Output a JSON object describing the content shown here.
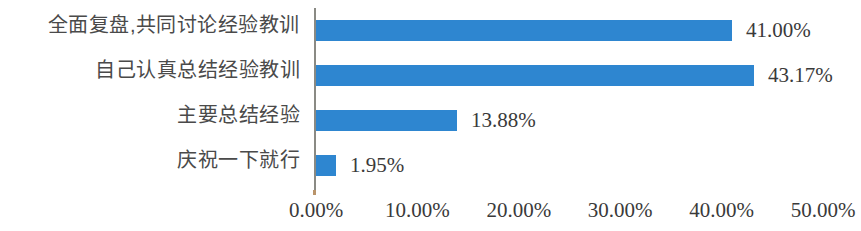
{
  "chart_data": {
    "type": "bar",
    "orientation": "horizontal",
    "title": "",
    "subtitle": "",
    "xlabel": "",
    "ylabel": "",
    "categories": [
      "全面复盘,共同讨论经验教训",
      "自己认真总结经验教训",
      "主要总结经验",
      "庆祝一下就行"
    ],
    "values": [
      41.0,
      43.17,
      13.88,
      1.95
    ],
    "value_labels": [
      "41.00%",
      "43.17%",
      "13.88%",
      "1.95%"
    ],
    "xlim": [
      0,
      50
    ],
    "xticks": [
      0,
      10,
      20,
      30,
      40,
      50
    ],
    "xtick_labels": [
      "0.00%",
      "10.00%",
      "20.00%",
      "30.00%",
      "40.00%",
      "50.00%"
    ],
    "grid": false,
    "legend": false,
    "legend_position": "none",
    "series": [
      {
        "name": "",
        "values": [
          41.0,
          43.17,
          13.88,
          1.95
        ],
        "color": "#2e86d0"
      }
    ],
    "colors": {
      "bar": "#2e86d0",
      "axis_line": "#8a8a84",
      "category_text": "#4a4a4a",
      "value_text": "#3a3a3a",
      "background": "#ffffff"
    }
  }
}
